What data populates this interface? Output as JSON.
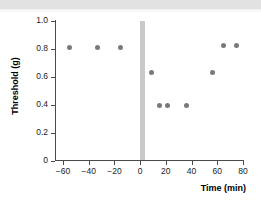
{
  "figure": {
    "background_color": "#ffffff",
    "banner_color": "#e2e2e2"
  },
  "chart_data": {
    "type": "scatter",
    "title": "",
    "xlabel": "Time (min)",
    "ylabel": "Threshold (g)",
    "xlim": [
      -60,
      80
    ],
    "ylim": [
      0,
      1.0
    ],
    "grid": false,
    "legend": null,
    "marker_color": "#7a7a7a",
    "x": [
      -55,
      -33,
      -15,
      9,
      15,
      21,
      36,
      56,
      65,
      75
    ],
    "y": [
      0.81,
      0.81,
      0.81,
      0.63,
      0.39,
      0.39,
      0.39,
      0.63,
      0.82,
      0.82
    ],
    "points": [
      {
        "x": -55,
        "y": 0.81
      },
      {
        "x": -33,
        "y": 0.81
      },
      {
        "x": -15,
        "y": 0.81
      },
      {
        "x": 9,
        "y": 0.63
      },
      {
        "x": 15,
        "y": 0.39
      },
      {
        "x": 21,
        "y": 0.39
      },
      {
        "x": 36,
        "y": 0.39
      },
      {
        "x": 56,
        "y": 0.63
      },
      {
        "x": 65,
        "y": 0.82
      },
      {
        "x": 75,
        "y": 0.82
      }
    ],
    "xticks": [
      -60,
      -40,
      -20,
      0,
      20,
      40,
      60,
      80
    ],
    "xtick_labels": [
      "−60",
      "−40",
      "−20",
      "0",
      "20",
      "40",
      "60",
      "80"
    ],
    "yticks": [
      0,
      0.2,
      0.4,
      0.6,
      0.8,
      1.0
    ],
    "ytick_labels": [
      "0",
      "0.2",
      "0.4",
      "0.6",
      "0.8",
      "1.0"
    ],
    "annotations": [
      {
        "name": "stimulus-band",
        "type": "vspan",
        "x_start": 0,
        "x_end": 4,
        "color": "#c9c9c9",
        "label": ""
      }
    ]
  }
}
